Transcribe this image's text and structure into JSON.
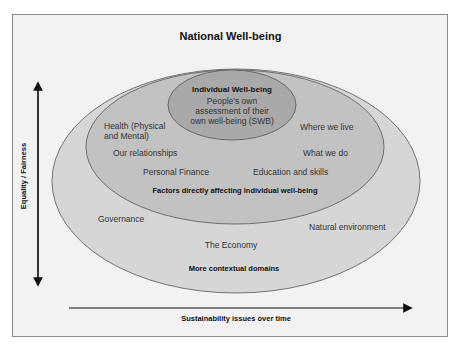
{
  "title": "National Well-being",
  "axes": {
    "vertical_label": "Equality / Fairness",
    "horizontal_label": "Sustainability issues over time"
  },
  "colors": {
    "background": "#f2f2f2",
    "outer_ellipse": "#d6d6d6",
    "middle_ellipse": "#c2c2c2",
    "inner_ellipse": "#a9a9a9",
    "stroke": "#555555"
  },
  "inner": {
    "title": "Individual Well-being",
    "line1": "People's own",
    "line2": "assessment of their",
    "line3": "own well-being (SWB)"
  },
  "middle": {
    "items": {
      "health_1": "Health (Physical",
      "health_2": "and Mental)",
      "relationships": "Our relationships",
      "finance": "Personal Finance",
      "where_live": "Where we live",
      "what_do": "What we do",
      "education": "Education and skills"
    },
    "caption": "Factors directly affecting individual well-being"
  },
  "outer": {
    "items": {
      "governance": "Governance",
      "economy": "The Economy",
      "environment": "Natural environment"
    },
    "caption": "More contextual domains"
  }
}
